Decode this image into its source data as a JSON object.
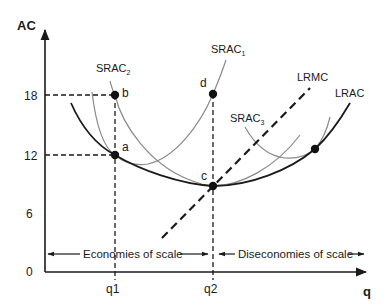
{
  "diagram": {
    "y_axis_label": "AC",
    "x_axis_label": "q",
    "y_ticks": [
      "18",
      "12",
      "6",
      "0"
    ],
    "x_ticks": [
      "q1",
      "q2"
    ],
    "curves": {
      "srac1": "SRAC",
      "srac1_sub": "1",
      "srac2": "SRAC",
      "srac2_sub": "2",
      "srac3": "SRAC",
      "srac3_sub": "3",
      "lrmc": "LRMC",
      "lrac": "LRAC"
    },
    "points": {
      "a": "a",
      "b": "b",
      "c": "c",
      "d": "d"
    },
    "ranges": {
      "economies": "Economies of scale",
      "diseconomies": "Diseconomies of scale"
    },
    "colors": {
      "axis": "#1a1a1a",
      "lrac": "#1a1a1a",
      "srac": "#808080",
      "dots": "#111111"
    }
  }
}
